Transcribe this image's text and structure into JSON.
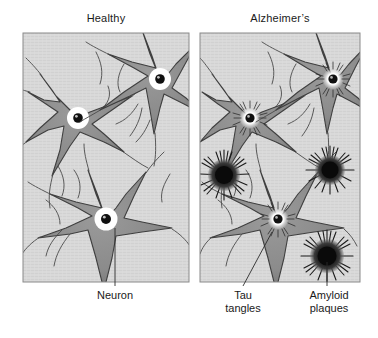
{
  "figure": {
    "kind": "medical-illustration",
    "background_color": "#ffffff",
    "panel_fill": "#d9d9d9",
    "panel_border_color": "#8a8a8a",
    "soma_fill": "#8e8e8e",
    "soma_stroke": "#3a3a3a",
    "nucleus_color": "#111111",
    "plaque_color": "#141414",
    "leader_line_color": "#2b2b2b"
  },
  "panels": [
    {
      "id": "healthy",
      "title": "Healthy",
      "x": 23,
      "y": 33,
      "width": 166,
      "height": 249,
      "neurons": [
        {
          "name": "neuron-top-left",
          "cx": 78,
          "cy": 118,
          "r": 30,
          "nucleus_type": "clear"
        },
        {
          "name": "neuron-top-right",
          "cx": 160,
          "cy": 79,
          "r": 30,
          "nucleus_type": "clear"
        },
        {
          "name": "neuron-bottom",
          "cx": 106,
          "cy": 219,
          "r": 33,
          "nucleus_type": "clear"
        }
      ],
      "plaques": []
    },
    {
      "id": "alzheimers",
      "title": "Alzheimer’s",
      "x": 200,
      "y": 33,
      "width": 160,
      "height": 249,
      "neurons": [
        {
          "name": "neuron-top-left",
          "cx": 250,
          "cy": 118,
          "r": 30,
          "nucleus_type": "tangled"
        },
        {
          "name": "neuron-top-right",
          "cx": 333,
          "cy": 79,
          "r": 30,
          "nucleus_type": "tangled"
        },
        {
          "name": "neuron-bottom",
          "cx": 278,
          "cy": 219,
          "r": 33,
          "nucleus_type": "tangled"
        }
      ],
      "plaques": [
        {
          "name": "amyloid-plaque-left",
          "cx": 224,
          "cy": 175,
          "r": 20
        },
        {
          "name": "amyloid-plaque-top-right",
          "cx": 330,
          "cy": 170,
          "r": 19
        },
        {
          "name": "amyloid-plaque-bottom-right",
          "cx": 327,
          "cy": 256,
          "r": 21
        }
      ]
    }
  ],
  "callouts": [
    {
      "id": "neuron",
      "lines": [
        "Neuron"
      ],
      "leader": {
        "x1": 115,
        "y1": 228,
        "x2": 115,
        "y2": 286
      }
    },
    {
      "id": "tau-tangles",
      "lines": [
        "Tau",
        "tangles"
      ],
      "leader": {
        "x1": 272,
        "y1": 232,
        "x2": 243,
        "y2": 286
      }
    },
    {
      "id": "amyloid-plaques",
      "lines": [
        "Amyloid",
        "plaques"
      ],
      "leader": {
        "x1": 327,
        "y1": 262,
        "x2": 327,
        "y2": 286
      }
    }
  ]
}
